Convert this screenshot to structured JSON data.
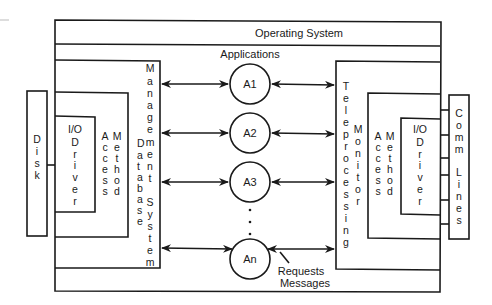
{
  "diagram": {
    "title": "Operating System",
    "applications_label": "Applications",
    "left_stack": {
      "dbms": "Management Database System",
      "dbms_col1": "Database",
      "dbms_col2": "Management System",
      "access_method": {
        "col1": "Access",
        "col2": "Method"
      },
      "io_driver": {
        "line1": "I/O",
        "line2": "Driver"
      },
      "device": "Disk"
    },
    "right_stack": {
      "tp_col1": "Teleprocessing",
      "tp_col2": "Monitor",
      "access_method": {
        "col1": "Access",
        "col2": "Method"
      },
      "io_driver": {
        "line1": "I/O",
        "line2": "Driver"
      },
      "device": {
        "col1": "Comm",
        "col2": "Lines"
      }
    },
    "applications": [
      {
        "id": "A1"
      },
      {
        "id": "A2"
      },
      {
        "id": "A3"
      },
      {
        "id": "An"
      }
    ],
    "ellipsis": "...",
    "annotation": {
      "line1": "Requests",
      "line2": "Messages"
    }
  }
}
